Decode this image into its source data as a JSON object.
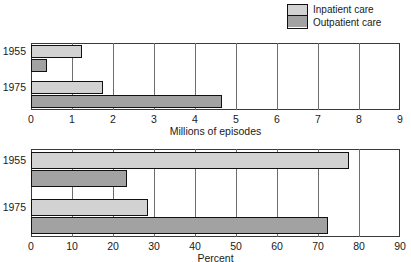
{
  "legend": {
    "items": [
      {
        "label": "Inpatient care",
        "color": "#d2d2d2",
        "key": "inpatient"
      },
      {
        "label": "Outpatient care",
        "color": "#a2a2a2",
        "key": "outpatient"
      }
    ]
  },
  "chart_data": [
    {
      "type": "bar",
      "orientation": "horizontal",
      "title": "",
      "xlabel": "Millions of episodes",
      "ylabel": "",
      "categories": [
        "1955",
        "1975"
      ],
      "series": [
        {
          "name": "Inpatient care",
          "color": "#d2d2d2",
          "values": [
            1.25,
            1.75
          ]
        },
        {
          "name": "Outpatient care",
          "color": "#a2a2a2",
          "values": [
            0.4,
            4.65
          ]
        }
      ],
      "xlim": [
        0,
        9
      ],
      "xticks": [
        "0",
        "1",
        "2",
        "3",
        "4",
        "5",
        "6",
        "7",
        "8",
        "9"
      ],
      "grid": true,
      "legend_position": "top-right"
    },
    {
      "type": "bar",
      "orientation": "horizontal",
      "title": "",
      "xlabel": "Percent",
      "ylabel": "",
      "categories": [
        "1955",
        "1975"
      ],
      "series": [
        {
          "name": "Inpatient care",
          "color": "#d2d2d2",
          "values": [
            77.5,
            28.5
          ]
        },
        {
          "name": "Outpatient care",
          "color": "#a2a2a2",
          "values": [
            23.5,
            72.5
          ]
        }
      ],
      "xlim": [
        0,
        90
      ],
      "xticks": [
        "0",
        "10",
        "20",
        "30",
        "40",
        "50",
        "60",
        "70",
        "80",
        "90"
      ],
      "grid": true,
      "legend_position": "top-right"
    }
  ]
}
